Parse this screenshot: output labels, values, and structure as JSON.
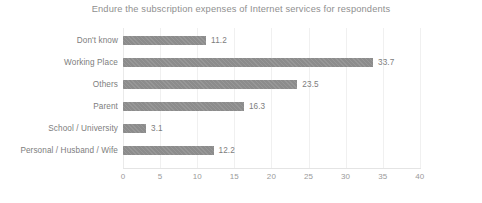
{
  "chart_data": {
    "type": "bar",
    "orientation": "horizontal",
    "title": "Endure the subscription expenses of Internet services for respondents",
    "xlabel": "",
    "ylabel": "",
    "categories": [
      "Don't know",
      "Working Place",
      "Others",
      "Parent",
      "School / University",
      "Personal / Husband / Wife"
    ],
    "values": [
      11.2,
      33.7,
      23.5,
      16.3,
      3.1,
      12.2
    ],
    "value_labels": [
      "11.2",
      "33.7",
      "23.5",
      "16.3",
      "3.1",
      "12.2"
    ],
    "xlim": [
      0,
      40
    ],
    "xticks": [
      0,
      5,
      10,
      15,
      20,
      25,
      30,
      35,
      40
    ],
    "xtick_labels": [
      "0",
      "5",
      "10",
      "15",
      "20",
      "25",
      "30",
      "35",
      "40"
    ],
    "grid": true,
    "grid_axis": "x",
    "legend": false,
    "bar_color": "#8c8c8c",
    "text_color": "#7d7d7d",
    "title_color": "#8f8f8f",
    "grid_color": "#f0f0f0",
    "background": "#ffffff"
  }
}
